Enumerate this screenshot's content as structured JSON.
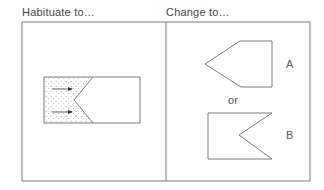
{
  "headers": {
    "left": "Habituate to…",
    "right": "Change to…"
  },
  "options": {
    "a_label": "A",
    "or_label": "or",
    "b_label": "B"
  },
  "colors": {
    "stroke": "#7a7a7a",
    "dots": "#9a9a9a",
    "arrow": "#333333"
  }
}
